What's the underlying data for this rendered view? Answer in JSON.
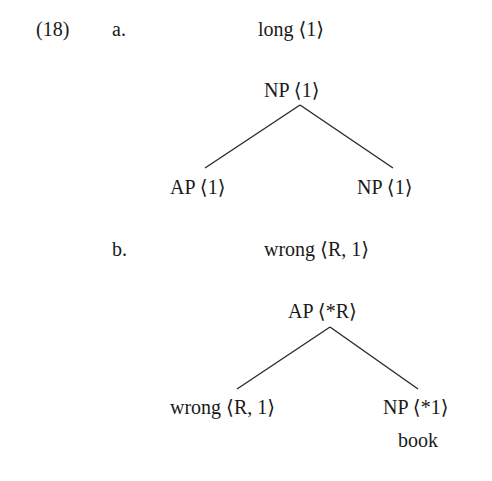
{
  "example": {
    "number": "(18)",
    "parts": [
      {
        "label": "a.",
        "lexical_entry": "long ⟨1⟩",
        "tree": {
          "root": "NP ⟨1⟩",
          "children": [
            "AP ⟨1⟩",
            "NP ⟨1⟩"
          ]
        }
      },
      {
        "label": "b.",
        "lexical_entry": "wrong ⟨R, 1⟩",
        "tree": {
          "root": "AP ⟨*R⟩",
          "children": [
            "wrong ⟨R, 1⟩",
            "NP ⟨*1⟩"
          ],
          "leaf_under_right": "book"
        }
      }
    ]
  },
  "colors": {
    "text": "#1a1a1a",
    "lines": "#2a2a2a",
    "background": "#ffffff"
  }
}
